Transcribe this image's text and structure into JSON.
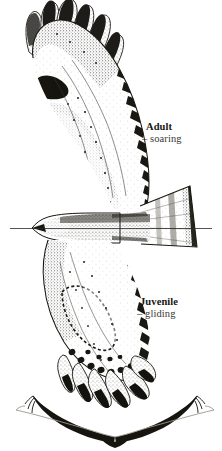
{
  "plate": {
    "background_color": "#ffffff",
    "ink_color": "#16150f",
    "mid_ink_color": "#5a5750",
    "light_ink_color": "#9d9a93",
    "width": 222,
    "height": 451,
    "medium": "pen-and-ink stipple illustration",
    "subject": "raptor in flight, ventral view"
  },
  "labels": {
    "adult": {
      "title": "Adult",
      "subtitle": "– soaring",
      "color": "#171614"
    },
    "juvenile": {
      "title": "Juvenile",
      "subtitle": "– gliding",
      "color": "#171614"
    }
  },
  "figures": {
    "main": {
      "name": "raptor-ventral-view",
      "parts": [
        "upper-wing-adult-soaring",
        "lower-wing-juvenile-gliding",
        "body-and-head",
        "tail-fanned"
      ]
    },
    "silhouette": {
      "name": "head-on-silhouette",
      "description": "frontal flight silhouette showing wing dihedral"
    }
  },
  "horizon_line": {
    "name": "body-axis-line",
    "color": "#2a2824"
  }
}
